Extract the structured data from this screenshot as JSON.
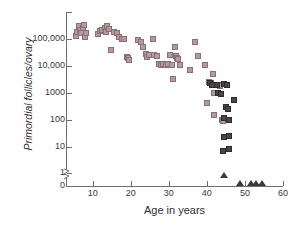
{
  "chart_data": {
    "type": "scatter",
    "title": "",
    "xlabel": "Age in years",
    "ylabel": "Primordial follicles/ovary",
    "xlim": [
      3,
      60
    ],
    "ylim_log": [
      1,
      1000000
    ],
    "yscale": "log-with-zero-break",
    "grid": false,
    "legend": "none",
    "y_tick_labels": [
      "100,000",
      "10,000",
      "1000",
      "100",
      "10",
      "1",
      "0"
    ],
    "y_tick_values": [
      100000,
      10000,
      1000,
      100,
      10,
      1,
      0
    ],
    "x_tick_labels": [
      "10",
      "20",
      "30",
      "40",
      "50",
      "60"
    ],
    "x_tick_values": [
      10,
      20,
      30,
      40,
      50,
      60
    ],
    "axis_break_between": [
      1,
      0
    ],
    "series": [
      {
        "name": "light-squares",
        "marker": "square",
        "color": "#b49a9c",
        "edge_color": "#8a6f74",
        "points": [
          {
            "x": 5.6,
            "y": 130000
          },
          {
            "x": 6.0,
            "y": 180000
          },
          {
            "x": 6.3,
            "y": 300000
          },
          {
            "x": 6.6,
            "y": 220000
          },
          {
            "x": 7.0,
            "y": 160000
          },
          {
            "x": 7.4,
            "y": 250000
          },
          {
            "x": 7.8,
            "y": 330000
          },
          {
            "x": 8.0,
            "y": 120000
          },
          {
            "x": 8.3,
            "y": 170000
          },
          {
            "x": 11.5,
            "y": 150000
          },
          {
            "x": 12.0,
            "y": 200000
          },
          {
            "x": 12.4,
            "y": 210000
          },
          {
            "x": 13.2,
            "y": 250000
          },
          {
            "x": 13.6,
            "y": 180000
          },
          {
            "x": 13.9,
            "y": 290000
          },
          {
            "x": 14.3,
            "y": 230000
          },
          {
            "x": 14.8,
            "y": 40000
          },
          {
            "x": 15.6,
            "y": 180000
          },
          {
            "x": 16.4,
            "y": 170000
          },
          {
            "x": 17.0,
            "y": 120000
          },
          {
            "x": 17.8,
            "y": 100000
          },
          {
            "x": 18.3,
            "y": 95000
          },
          {
            "x": 19.0,
            "y": 22000
          },
          {
            "x": 19.3,
            "y": 19000
          },
          {
            "x": 19.6,
            "y": 17000
          },
          {
            "x": 21.8,
            "y": 90000
          },
          {
            "x": 22.6,
            "y": 80000
          },
          {
            "x": 23.2,
            "y": 50000
          },
          {
            "x": 24.0,
            "y": 28000
          },
          {
            "x": 24.4,
            "y": 22000
          },
          {
            "x": 24.8,
            "y": 26000
          },
          {
            "x": 25.8,
            "y": 100000
          },
          {
            "x": 26.2,
            "y": 25000
          },
          {
            "x": 26.8,
            "y": 24000
          },
          {
            "x": 27.4,
            "y": 12000
          },
          {
            "x": 28.0,
            "y": 11000
          },
          {
            "x": 28.6,
            "y": 11500
          },
          {
            "x": 29.2,
            "y": 11000
          },
          {
            "x": 29.8,
            "y": 12000
          },
          {
            "x": 30.4,
            "y": 25000
          },
          {
            "x": 30.8,
            "y": 11000
          },
          {
            "x": 31.0,
            "y": 3200
          },
          {
            "x": 31.6,
            "y": 50000
          },
          {
            "x": 31.9,
            "y": 24000
          },
          {
            "x": 32.2,
            "y": 20000
          },
          {
            "x": 32.5,
            "y": 18000
          },
          {
            "x": 33.0,
            "y": 11000
          },
          {
            "x": 35.6,
            "y": 7000
          },
          {
            "x": 37.0,
            "y": 80000
          },
          {
            "x": 37.6,
            "y": 24000
          },
          {
            "x": 39.6,
            "y": 11000
          },
          {
            "x": 40.0,
            "y": 400
          },
          {
            "x": 40.5,
            "y": 2500
          },
          {
            "x": 41.0,
            "y": 2200
          },
          {
            "x": 41.6,
            "y": 5000
          },
          {
            "x": 41.8,
            "y": 1000
          },
          {
            "x": 42.0,
            "y": 150
          },
          {
            "x": 43.0,
            "y": 2000
          },
          {
            "x": 43.4,
            "y": 1800
          },
          {
            "x": 44.0,
            "y": 100
          },
          {
            "x": 44.2,
            "y": 90
          }
        ]
      },
      {
        "name": "dark-squares",
        "marker": "square",
        "color": "#4a4548",
        "edge_color": "#2e2b2e",
        "points": [
          {
            "x": 40.8,
            "y": 2300
          },
          {
            "x": 41.4,
            "y": 1900
          },
          {
            "x": 42.6,
            "y": 1900
          },
          {
            "x": 43.0,
            "y": 1000
          },
          {
            "x": 43.6,
            "y": 900
          },
          {
            "x": 44.6,
            "y": 2100
          },
          {
            "x": 45.4,
            "y": 1900
          },
          {
            "x": 45.0,
            "y": 300
          },
          {
            "x": 45.6,
            "y": 250
          },
          {
            "x": 44.6,
            "y": 110
          },
          {
            "x": 45.8,
            "y": 100
          },
          {
            "x": 47.0,
            "y": 520
          },
          {
            "x": 44.4,
            "y": 22
          },
          {
            "x": 45.8,
            "y": 24
          },
          {
            "x": 44.3,
            "y": 7
          },
          {
            "x": 45.8,
            "y": 8
          }
        ]
      },
      {
        "name": "triangles-zero-or-one",
        "marker": "triangle",
        "color": "#3b383c",
        "points": [
          {
            "x": 44.5,
            "y": 0.7
          },
          {
            "x": 48.8,
            "y": 0
          },
          {
            "x": 51.6,
            "y": 0
          },
          {
            "x": 52.8,
            "y": 0
          },
          {
            "x": 54.4,
            "y": 0
          }
        ]
      }
    ]
  },
  "axes": {
    "y_title": "Primordial follicles/ovary",
    "x_title": "Age in years",
    "y_ticks": [
      {
        "label": "100,000",
        "value": 100000
      },
      {
        "label": "10,000",
        "value": 10000
      },
      {
        "label": "1000",
        "value": 1000
      },
      {
        "label": "100",
        "value": 100
      },
      {
        "label": "10",
        "value": 10
      },
      {
        "label": "1",
        "value": 1
      },
      {
        "label": "0",
        "value": 0
      }
    ],
    "x_ticks": [
      {
        "label": "10",
        "value": 10
      },
      {
        "label": "20",
        "value": 20
      },
      {
        "label": "30",
        "value": 30
      },
      {
        "label": "40",
        "value": 40
      },
      {
        "label": "50",
        "value": 50
      },
      {
        "label": "60",
        "value": 60
      }
    ]
  },
  "colors": {
    "axis": "#6e6e72",
    "text": "#2e2e30",
    "light_marker_fill": "#b49a9c",
    "light_marker_edge": "#8a6f74",
    "dark_marker_fill": "#4a4548",
    "dark_marker_edge": "#2e2b2e",
    "triangle": "#3b383c",
    "background": "#ffffff"
  }
}
